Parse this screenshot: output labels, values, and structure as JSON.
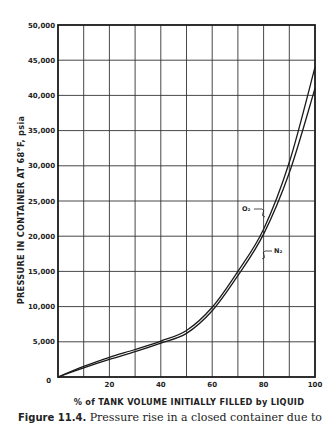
{
  "chart_data": {
    "type": "line",
    "title": "",
    "xlabel": "% of TANK VOLUME INITIALLY FILLED by LIQUID",
    "ylabel": "PRESSURE IN CONTAINER AT 68°F, psia",
    "xlim": [
      0,
      100
    ],
    "ylim": [
      0,
      50000
    ],
    "grid": true,
    "legend_position": "inline labels",
    "x_ticks": [
      "0",
      "20",
      "40",
      "60",
      "80",
      "100"
    ],
    "y_ticks": [
      "5,000",
      "10,000",
      "15,000",
      "20,000",
      "25,000",
      "30,000",
      "35,000",
      "40,000",
      "45,000",
      "50,000"
    ],
    "x": [
      0,
      10,
      20,
      30,
      40,
      50,
      60,
      70,
      80,
      90,
      100
    ],
    "series": [
      {
        "name": "O2",
        "label": "O₂",
        "values": [
          0,
          1500,
          2800,
          3900,
          5100,
          6600,
          9900,
          15000,
          21000,
          30500,
          44000
        ]
      },
      {
        "name": "N2",
        "label": "N₂",
        "values": [
          0,
          1300,
          2500,
          3600,
          4800,
          6200,
          9400,
          14400,
          20300,
          29000,
          41000
        ]
      }
    ],
    "annotations": [
      {
        "text": "O₂",
        "points_to": "O2 curve near 80%, ~24,000 psia"
      },
      {
        "text": "N₂",
        "points_to": "N2 curve near 83%, ~19,000 psia"
      }
    ]
  },
  "labels": {
    "y_zero": "0",
    "o2": "O₂",
    "n2": "N₂"
  },
  "caption": {
    "prefix": "Figure 11.4.",
    "text": "Pressure rise in a closed container due to"
  }
}
